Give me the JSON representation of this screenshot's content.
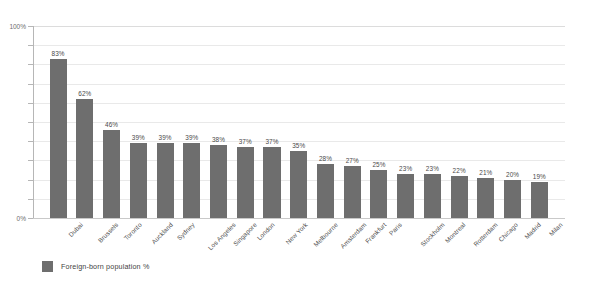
{
  "chart_data": {
    "type": "bar",
    "title": "",
    "subtitle": "",
    "xlabel": "",
    "ylabel": "",
    "ylim": [
      0,
      100
    ],
    "y_tick_labels": [
      "0%",
      "100%"
    ],
    "y_tick_values": [
      0,
      10,
      20,
      30,
      40,
      50,
      60,
      70,
      80,
      90,
      100
    ],
    "grid": true,
    "legend_position": "bottom-left",
    "legend": [
      "Foreign-born population %"
    ],
    "series_name": "Foreign-born population %",
    "bar_color": "#6e6e6e",
    "categories": [
      "Dubai",
      "Brussels",
      "Toronto",
      "Auckland",
      "Sydney",
      "Los Angeles",
      "Singapore",
      "London",
      "New York",
      "Melbourne",
      "Amsterdam",
      "Frankfurt",
      "Paris",
      "Stockholm",
      "Montreal",
      "Rotterdam",
      "Chicago",
      "Madrid",
      "Milan"
    ],
    "values": [
      83,
      62,
      46,
      39,
      39,
      39,
      38,
      37,
      37,
      35,
      28,
      27,
      25,
      23,
      23,
      22,
      21,
      20,
      19
    ],
    "data_labels": [
      "83%",
      "62%",
      "46%",
      "39%",
      "39%",
      "39%",
      "38%",
      "37%",
      "37%",
      "35%",
      "28%",
      "27%",
      "25%",
      "23%",
      "23%",
      "22%",
      "21%",
      "20%",
      "19%"
    ]
  },
  "axis": {
    "y_max_label": "100%",
    "y_min_label": "0%"
  },
  "legend": {
    "label": "Foreign-born population %"
  }
}
